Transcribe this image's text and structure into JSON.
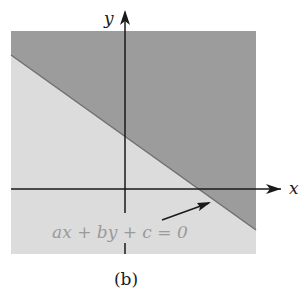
{
  "figure": {
    "caption": "(b)",
    "axes": {
      "x_label": "x",
      "y_label": "y"
    },
    "boundary_line": {
      "equation": "ax + by + c = 0"
    },
    "regions": {
      "shaded_half_plane": "upper-right",
      "unshaded_half_plane": "lower-left"
    },
    "colors": {
      "dark_region": "#9a9a9a",
      "light_region": "#dcdcdc",
      "axis": "#1a1a1a",
      "equation_text": "#9a9a9a",
      "boundary": "#6e6e6e"
    }
  }
}
